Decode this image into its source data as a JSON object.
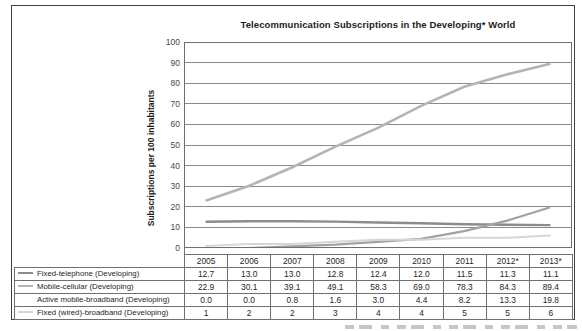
{
  "chart_data": {
    "type": "line",
    "title": "Telecommunication Subscriptions in the Developing* World",
    "ylabel": "Subscriptions per 100 inhabitants",
    "xlabel": "",
    "ylim": [
      0,
      100
    ],
    "y_ticks": [
      "0",
      "10",
      "20",
      "30",
      "40",
      "50",
      "60",
      "70",
      "80",
      "90",
      "100"
    ],
    "grid": true,
    "legend_position": "table-left-column",
    "categories": [
      "2005",
      "2006",
      "2007",
      "2008",
      "2009",
      "2010",
      "2011",
      "2012*",
      "2013*"
    ],
    "series": [
      {
        "name": "Fixed-telephone (Developing)",
        "color": "#8c8c8c",
        "legend_marker": "#8c8c8c",
        "values": [
          12.7,
          13.0,
          13.0,
          12.8,
          12.4,
          12.0,
          11.5,
          11.3,
          11.1
        ],
        "display": [
          "12.7",
          "13.0",
          "13.0",
          "12.8",
          "12.4",
          "12.0",
          "11.5",
          "11.3",
          "11.1"
        ]
      },
      {
        "name": "Mobile-cellular (Developing)",
        "color": "#b4b4b4",
        "legend_marker": "#b4b4b4",
        "values": [
          22.9,
          30.1,
          39.1,
          49.1,
          58.3,
          69.0,
          78.3,
          84.3,
          89.4
        ],
        "display": [
          "22.9",
          "30.1",
          "39.1",
          "49.1",
          "58.3",
          "69.0",
          "78.3",
          "84.3",
          "89.4"
        ]
      },
      {
        "name": "Active mobile-broadband (Developing)",
        "color": "#a2a2a2",
        "legend_marker": "none",
        "values": [
          0.0,
          0.0,
          0.8,
          1.6,
          3.0,
          4.4,
          8.2,
          13.3,
          19.8
        ],
        "display": [
          "0.0",
          "0.0",
          "0.8",
          "1.6",
          "3.0",
          "4.4",
          "8.2",
          "13.3",
          "19.8"
        ]
      },
      {
        "name": "Fixed (wired)-broadband (Developing)",
        "color": "#d6d6d6",
        "legend_marker": "#d6d6d6",
        "values": [
          1,
          2,
          2,
          3,
          4,
          4,
          5,
          5,
          6
        ],
        "display": [
          "1",
          "2",
          "2",
          "3",
          "4",
          "4",
          "5",
          "5",
          "6"
        ]
      }
    ]
  }
}
